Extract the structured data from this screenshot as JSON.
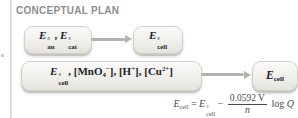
{
  "heading": {
    "label": "CONCEPTUAL PLAN"
  },
  "colors": {
    "background": "#ffffff",
    "heading_text": "#8e8e8e",
    "box_fill_top": "#fbfaf8",
    "box_fill_bottom": "#e4e3de",
    "box_border": "#cfcec8",
    "box_text": "#1b1d2b",
    "arrow": "#b3b2ae",
    "equation_text": "#4c4b49",
    "column_rule": "#dcdbd8"
  },
  "plan": {
    "rows": [
      {
        "given": {
          "plain": "E°an, E°cat",
          "formula": [
            {
              "k": "it",
              "v": "E"
            },
            {
              "k": "ss",
              "sup": "°",
              "sub": "an"
            },
            {
              "k": "tx",
              "v": ", "
            },
            {
              "k": "it",
              "v": "E"
            },
            {
              "k": "ss",
              "sup": "°",
              "sub": "cat"
            }
          ]
        },
        "find": {
          "plain": "E°cell",
          "formula": [
            {
              "k": "it",
              "v": "E"
            },
            {
              "k": "ss",
              "sup": "°",
              "sub": "cell"
            }
          ]
        }
      },
      {
        "given": {
          "plain": "E°cell, [MnO4−], [H+], [Cu2+]",
          "formula": [
            {
              "k": "it",
              "v": "E"
            },
            {
              "k": "ss",
              "sup": "°",
              "sub": "cell"
            },
            {
              "k": "tx",
              "v": ", ["
            },
            {
              "k": "tx",
              "v": "MnO"
            },
            {
              "k": "sub",
              "v": "4"
            },
            {
              "k": "sup",
              "v": "−"
            },
            {
              "k": "tx",
              "v": "], ["
            },
            {
              "k": "tx",
              "v": "H"
            },
            {
              "k": "sup",
              "v": "+"
            },
            {
              "k": "tx",
              "v": "], ["
            },
            {
              "k": "tx",
              "v": "Cu"
            },
            {
              "k": "sup",
              "v": "2+"
            },
            {
              "k": "tx",
              "v": "]"
            }
          ]
        },
        "find": {
          "plain": "Ecell",
          "formula": [
            {
              "k": "it",
              "v": "E"
            },
            {
              "k": "sub",
              "v": "cell"
            }
          ]
        }
      }
    ]
  },
  "equation": {
    "plain": "Ecell = E°cell − (0.0592 V / n) log Q",
    "formula": [
      {
        "k": "it",
        "v": "E"
      },
      {
        "k": "sub",
        "v": "cell"
      },
      {
        "k": "tx",
        "v": " = "
      },
      {
        "k": "it",
        "v": "E"
      },
      {
        "k": "ss",
        "sup": "°",
        "sub": "cell"
      },
      {
        "k": "tx",
        "v": " − "
      },
      {
        "k": "frac",
        "num": "0.0592 V",
        "den": "n"
      },
      {
        "k": "tx",
        "v": " log "
      },
      {
        "k": "it",
        "v": "Q"
      }
    ]
  }
}
